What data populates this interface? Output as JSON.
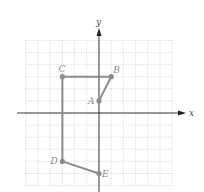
{
  "diagram": {
    "type": "coordinate-plane-polyline",
    "axes": {
      "x_label": "x",
      "y_label": "y",
      "x_range": [
        -6,
        6
      ],
      "y_range": [
        -6,
        6
      ],
      "grid_step": 1
    },
    "colors": {
      "grid": "#b8b8b8",
      "axis": "#222222",
      "path": "#8c8c8c",
      "point": "#8c8c8c",
      "label": "#8a8a8a"
    },
    "points": [
      {
        "name": "A",
        "x": 0,
        "y": 1
      },
      {
        "name": "B",
        "x": 1,
        "y": 3
      },
      {
        "name": "C",
        "x": -3,
        "y": 3
      },
      {
        "name": "D",
        "x": -3,
        "y": -4
      },
      {
        "name": "E",
        "x": 0,
        "y": -5
      }
    ],
    "path_order": [
      "A",
      "B",
      "C",
      "D",
      "E"
    ]
  }
}
